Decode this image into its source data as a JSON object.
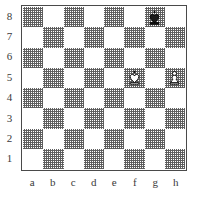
{
  "diagram": {
    "type": "chess-board-diagram",
    "orientation": "white-bottom",
    "board_size": 8,
    "colors": {
      "light_square": "#ffffff",
      "dark_square": "#8a8a8a",
      "border": "#4a4a4a",
      "label_text": "#3a3a3a",
      "background": "#ffffff",
      "piece_outline": "#000000",
      "white_piece_fill": "#ffffff",
      "black_piece_fill": "#1a1a1a"
    },
    "rank_labels": [
      "8",
      "7",
      "6",
      "5",
      "4",
      "3",
      "2",
      "1"
    ],
    "file_labels": [
      "a",
      "b",
      "c",
      "d",
      "e",
      "f",
      "g",
      "h"
    ],
    "pieces": [
      {
        "square": "g8",
        "file": "g",
        "rank": "8",
        "color": "black",
        "type": "king",
        "symbol": "♚",
        "name": "black-king"
      },
      {
        "square": "f5",
        "file": "f",
        "rank": "5",
        "color": "white",
        "type": "king",
        "symbol": "♔",
        "name": "white-king"
      },
      {
        "square": "h5",
        "file": "h",
        "rank": "5",
        "color": "white",
        "type": "pawn",
        "symbol": "♙",
        "name": "white-pawn"
      }
    ],
    "position_fen": "6k1/8/8/5K1P/8/8/8/8",
    "piece_count": {
      "white": 2,
      "black": 1,
      "total": 3
    }
  }
}
